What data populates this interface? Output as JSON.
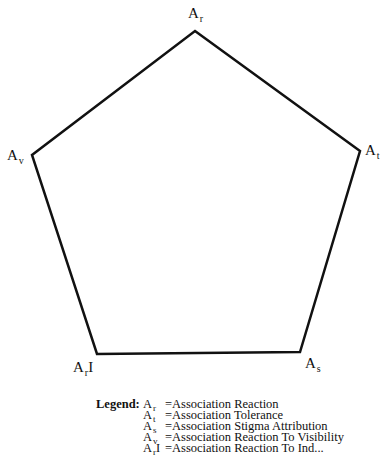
{
  "diagram": {
    "type": "pentagon",
    "stroke_color": "#111111",
    "stroke_width": 2.5,
    "vertices": [
      {
        "id": "ar",
        "base": "A",
        "sub": "r",
        "suffix": "",
        "x": 195,
        "y": 31,
        "label_x": 188,
        "label_y": 6
      },
      {
        "id": "at",
        "base": "A",
        "sub": "t",
        "suffix": "",
        "x": 360,
        "y": 151,
        "label_x": 365,
        "label_y": 143
      },
      {
        "id": "as",
        "base": "A",
        "sub": "s",
        "suffix": "",
        "x": 300,
        "y": 352,
        "label_x": 305,
        "label_y": 356
      },
      {
        "id": "ari",
        "base": "A",
        "sub": "r",
        "suffix": "I",
        "x": 97,
        "y": 354,
        "label_x": 73,
        "label_y": 360
      },
      {
        "id": "av",
        "base": "A",
        "sub": "v",
        "suffix": "",
        "x": 32,
        "y": 155,
        "label_x": 7,
        "label_y": 148
      }
    ]
  },
  "legend": {
    "title": "Legend:",
    "items": [
      {
        "base": "A",
        "sub": "r",
        "suffix": "",
        "definition": "=Association Reaction"
      },
      {
        "base": "A",
        "sub": "t",
        "suffix": "",
        "definition": "=Association Tolerance"
      },
      {
        "base": "A",
        "sub": "s",
        "suffix": "",
        "definition": "=Association Stigma Attribution"
      },
      {
        "base": "A",
        "sub": "v",
        "suffix": "",
        "definition": "=Association Reaction To Visibility"
      },
      {
        "base": "A",
        "sub": "r",
        "suffix": "I",
        "definition": "=Association Reaction To Ind..."
      }
    ]
  }
}
